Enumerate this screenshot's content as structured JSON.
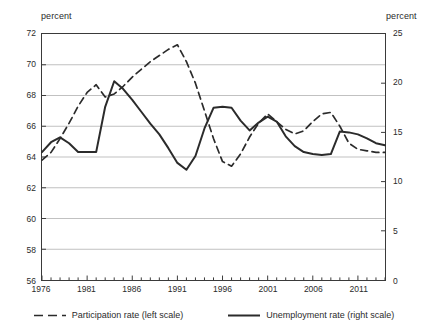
{
  "axis_titles": {
    "left": "percent",
    "right": "percent"
  },
  "legend": {
    "participation": "Participation rate (left scale)",
    "unemployment": "Unemployment rate (right scale)"
  },
  "colors": {
    "line": "#2b2b2b",
    "grid": "#b9b9b9",
    "frame": "#3a3a3a",
    "text": "#2b2b2b"
  },
  "chart_data": {
    "type": "line",
    "title": "",
    "xlabel": "",
    "ylabel": "percent",
    "y2label": "percent",
    "grid": true,
    "legend_position": "bottom",
    "xlim": [
      1976,
      2014
    ],
    "ylim": [
      56,
      72
    ],
    "y2lim": [
      0,
      25
    ],
    "yticks": [
      56,
      58,
      60,
      62,
      64,
      66,
      68,
      70,
      72
    ],
    "y2ticks": [
      0,
      5,
      10,
      15,
      20,
      25
    ],
    "xticks": [
      1976,
      1981,
      1986,
      1991,
      1996,
      2001,
      2006,
      2011
    ],
    "xtick_minor_interval": 1,
    "x": [
      1976,
      1977,
      1978,
      1979,
      1980,
      1981,
      1982,
      1983,
      1984,
      1985,
      1986,
      1987,
      1988,
      1989,
      1990,
      1991,
      1992,
      1993,
      1994,
      1995,
      1996,
      1997,
      1998,
      1999,
      2000,
      2001,
      2002,
      2003,
      2004,
      2005,
      2006,
      2007,
      2008,
      2009,
      2010,
      2011,
      2012,
      2013,
      2014
    ],
    "series": [
      {
        "name": "Participation rate (left scale)",
        "axis": "left",
        "style": "dashed",
        "values": [
          63.8,
          64.3,
          65.2,
          66.2,
          67.3,
          68.2,
          68.7,
          67.9,
          68.1,
          68.6,
          69.2,
          69.7,
          70.2,
          70.6,
          71.0,
          71.3,
          70.2,
          68.8,
          67.0,
          65.2,
          63.7,
          63.4,
          64.2,
          65.3,
          66.2,
          66.8,
          66.3,
          65.8,
          65.5,
          65.7,
          66.3,
          66.8,
          66.9,
          66.0,
          64.9,
          64.5,
          64.4,
          64.3,
          64.3
        ]
      },
      {
        "name": "Unemployment rate (right scale)",
        "axis": "right",
        "style": "solid",
        "values": [
          13.0,
          14.0,
          14.5,
          13.9,
          13.0,
          13.0,
          13.0,
          17.6,
          20.2,
          19.4,
          18.3,
          17.1,
          15.9,
          14.8,
          13.4,
          11.9,
          11.2,
          12.6,
          15.4,
          17.5,
          17.6,
          17.5,
          16.2,
          15.2,
          16.0,
          16.6,
          16.1,
          14.6,
          13.6,
          13.0,
          12.8,
          12.7,
          12.8,
          15.1,
          15.0,
          14.8,
          14.4,
          13.9,
          13.7
        ]
      }
    ]
  }
}
